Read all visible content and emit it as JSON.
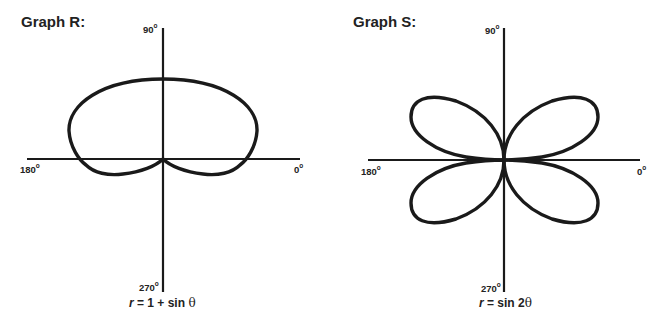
{
  "graphs": [
    {
      "id": "R",
      "title": "Graph R:",
      "equation": {
        "lhs": "r",
        "rhs_prefix": " = 1 + sin ",
        "theta": "θ"
      },
      "axis_labels": {
        "top": "90",
        "left": "180",
        "right": "0",
        "bottom": "270",
        "degree": "o"
      },
      "curve": "limacon/cardioid-like loop above the horizontal axis with two small lobes below near the origin"
    },
    {
      "id": "S",
      "title": "Graph S:",
      "equation": {
        "lhs": "r",
        "rhs_prefix": " = sin 2",
        "theta": "θ"
      },
      "axis_labels": {
        "top": "90",
        "left": "180",
        "right": "0",
        "bottom": "270",
        "degree": "o"
      },
      "curve": "four-petal rose with petals in each quadrant"
    }
  ],
  "colors": {
    "stroke": "#1a1a1a",
    "background": "#ffffff"
  }
}
